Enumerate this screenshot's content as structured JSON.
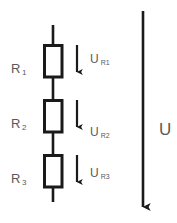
{
  "diagram": {
    "background_color": "#ffffff",
    "line_color": "#1a1a1a",
    "text_color": "#59595b",
    "resistors": [
      {
        "label_main": "R",
        "label_sub": "1",
        "name": "resistor-1"
      },
      {
        "label_main": "R",
        "label_sub": "2",
        "name": "resistor-2"
      },
      {
        "label_main": "R",
        "label_sub": "3",
        "name": "resistor-3"
      }
    ],
    "voltage_drops": [
      {
        "label_main": "U",
        "label_sub": "R1",
        "name": "voltage-drop-1"
      },
      {
        "label_main": "U",
        "label_sub": "R2",
        "name": "voltage-drop-2"
      },
      {
        "label_main": "U",
        "label_sub": "R3",
        "name": "voltage-drop-3"
      }
    ],
    "total_voltage": {
      "label": "U",
      "name": "total-voltage"
    },
    "arrows": {
      "drop_arrow_name": "voltage-drop-arrow",
      "total_arrow_name": "total-voltage-arrow"
    }
  }
}
